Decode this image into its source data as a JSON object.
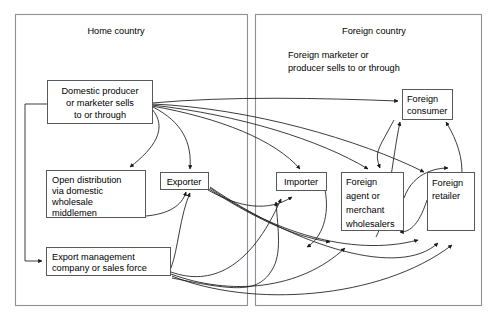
{
  "diagram": {
    "type": "flow-diagram",
    "containers": [
      {
        "id": "home-country",
        "label": "Home country"
      },
      {
        "id": "foreign-country",
        "label": "Foreign country"
      }
    ],
    "annotations": [
      {
        "id": "foreign-marketer-note",
        "line1": "Foreign marketer or",
        "line2": "producer sells to or through"
      }
    ],
    "nodes": [
      {
        "id": "domestic-producer",
        "lines": [
          "Domestic producer",
          "or marketer sells",
          "to or through"
        ],
        "align": "center"
      },
      {
        "id": "open-distribution",
        "lines": [
          "Open distribution",
          "via domestic",
          "wholesale",
          "middlemen"
        ],
        "align": "left"
      },
      {
        "id": "exporter",
        "lines": [
          "Exporter"
        ],
        "align": "center"
      },
      {
        "id": "export-management",
        "lines": [
          "Export management",
          "company or sales force"
        ],
        "align": "left"
      },
      {
        "id": "foreign-consumer",
        "lines": [
          "Foreign",
          "consumer"
        ],
        "align": "left"
      },
      {
        "id": "importer",
        "lines": [
          "Importer"
        ],
        "align": "center"
      },
      {
        "id": "foreign-agent",
        "lines": [
          "Foreign",
          "agent or",
          "merchant",
          "wholesalers"
        ],
        "align": "left"
      },
      {
        "id": "foreign-retailer",
        "lines": [
          "Foreign",
          "retailer"
        ],
        "align": "left"
      }
    ],
    "colors": {
      "box_stroke": "#555a5e",
      "container_stroke": "#8d9196",
      "arrow_stroke": "#1a1a1a",
      "background": "#ffffff",
      "text": "#000000"
    }
  }
}
